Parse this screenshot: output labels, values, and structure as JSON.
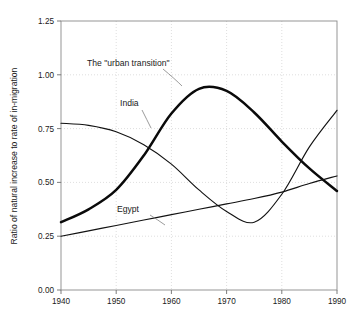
{
  "chart_data": {
    "type": "line",
    "title": "",
    "xlabel": "",
    "ylabel": "Ratio of natural increase to rate of in-migration",
    "xlim": [
      1940,
      1990
    ],
    "ylim": [
      0.0,
      1.25
    ],
    "grid": true,
    "legend_position": "inline-annotations",
    "xticks": [
      "1940",
      "1950",
      "1960",
      "1970",
      "1980",
      "1990"
    ],
    "xtick_values": [
      1940,
      1950,
      1960,
      1970,
      1980,
      1990
    ],
    "yticks": [
      "0.00",
      "0.25",
      "0.50",
      "0.75",
      "1.00",
      "1.25"
    ],
    "ytick_values": [
      0.0,
      0.25,
      0.5,
      0.75,
      1.0,
      1.25
    ],
    "x": [
      1940,
      1945,
      1950,
      1955,
      1960,
      1965,
      1970,
      1975,
      1980,
      1985,
      1990
    ],
    "series": [
      {
        "name": "The \"urban transition\"",
        "style": "thick",
        "values": [
          0.315,
          0.375,
          0.465,
          0.625,
          0.82,
          0.935,
          0.925,
          0.825,
          0.69,
          0.565,
          0.46
        ]
      },
      {
        "name": "India",
        "style": "thin",
        "values": [
          0.775,
          0.765,
          0.735,
          0.675,
          0.585,
          0.465,
          0.365,
          0.315,
          0.445,
          0.665,
          0.835
        ]
      },
      {
        "name": "Egypt",
        "style": "thin",
        "values": [
          0.25,
          0.275,
          0.3,
          0.325,
          0.35,
          0.375,
          0.4,
          0.425,
          0.455,
          0.495,
          0.53
        ]
      }
    ],
    "annotations": [
      {
        "text": "The \"urban transition\"",
        "series": "The \"urban transition\""
      },
      {
        "text": "India",
        "series": "India"
      },
      {
        "text": "Egypt",
        "series": "Egypt"
      }
    ]
  },
  "colors": {
    "curve": "#0a0a0a",
    "grid": "#c8c8c8",
    "frame": "#8a8a8a",
    "background": "#ffffff"
  }
}
